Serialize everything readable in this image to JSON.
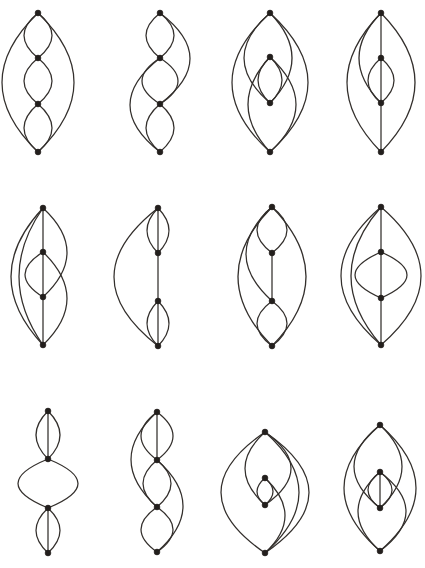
{
  "figure": {
    "background_color": "#ffffff",
    "edge_color": "#332f2c",
    "vertex_color": "#231f1d",
    "edge_stroke_width": 1.25,
    "vertex_radius": 2.9,
    "rows": 3,
    "columns": 4,
    "canvas": {
      "width": 425,
      "height": 568
    }
  },
  "chart_data": {
    "type": "diagram",
    "graphs": [
      {
        "id": "graph-1",
        "cell": {
          "row": 1,
          "column": 1
        },
        "vertex_count": 4,
        "edge_count": 8,
        "origin": {
          "x": 14,
          "y": 8
        },
        "vertices": [
          {
            "name": "v1",
            "x": 38,
            "y": 13
          },
          {
            "name": "v2",
            "x": 38,
            "y": 58
          },
          {
            "name": "v3",
            "x": 38,
            "y": 104
          },
          {
            "name": "v4",
            "x": 38,
            "y": 152
          }
        ],
        "edges": [
          {
            "from": "v1",
            "to": "v4",
            "bow": -36
          },
          {
            "from": "v1",
            "to": "v4",
            "bow": 36
          },
          {
            "from": "v1",
            "to": "v2",
            "bow": -14
          },
          {
            "from": "v1",
            "to": "v2",
            "bow": 14
          },
          {
            "from": "v2",
            "to": "v3",
            "bow": -14
          },
          {
            "from": "v2",
            "to": "v3",
            "bow": 14
          },
          {
            "from": "v3",
            "to": "v4",
            "bow": -14
          },
          {
            "from": "v3",
            "to": "v4",
            "bow": 14
          }
        ]
      },
      {
        "id": "graph-2",
        "cell": {
          "row": 1,
          "column": 2
        },
        "vertex_count": 4,
        "edge_count": 8,
        "origin": {
          "x": 122,
          "y": 8
        },
        "vertices": [
          {
            "name": "v1",
            "x": 160,
            "y": 13
          },
          {
            "name": "v2",
            "x": 160,
            "y": 58
          },
          {
            "name": "v3",
            "x": 160,
            "y": 104
          },
          {
            "name": "v4",
            "x": 160,
            "y": 152
          }
        ],
        "edges": [
          {
            "from": "v1",
            "to": "v3",
            "bow": 30
          },
          {
            "from": "v2",
            "to": "v4",
            "bow": -30
          },
          {
            "from": "v1",
            "to": "v2",
            "bow": -14
          },
          {
            "from": "v1",
            "to": "v2",
            "bow": 14
          },
          {
            "from": "v2",
            "to": "v3",
            "bow": -18
          },
          {
            "from": "v2",
            "to": "v3",
            "bow": 18
          },
          {
            "from": "v3",
            "to": "v4",
            "bow": -14
          },
          {
            "from": "v3",
            "to": "v4",
            "bow": 14
          }
        ]
      },
      {
        "id": "graph-3",
        "cell": {
          "row": 1,
          "column": 3
        },
        "vertex_count": 4,
        "edge_count": 8,
        "origin": {
          "x": 230,
          "y": 8
        },
        "vertices": [
          {
            "name": "v1",
            "x": 270,
            "y": 13
          },
          {
            "name": "v2",
            "x": 270,
            "y": 57
          },
          {
            "name": "v3",
            "x": 270,
            "y": 103
          },
          {
            "name": "v4",
            "x": 270,
            "y": 152
          }
        ],
        "edges": [
          {
            "from": "v1",
            "to": "v4",
            "bow": -38
          },
          {
            "from": "v1",
            "to": "v4",
            "bow": 38
          },
          {
            "from": "v1",
            "to": "v3",
            "bow": -26
          },
          {
            "from": "v2",
            "to": "v4",
            "bow": 26
          },
          {
            "from": "v2",
            "to": "v3",
            "bow": -12
          },
          {
            "from": "v2",
            "to": "v3",
            "bow": 12
          },
          {
            "from": "v1",
            "to": "v3",
            "bow": 22
          },
          {
            "from": "v2",
            "to": "v4",
            "bow": -22
          }
        ]
      },
      {
        "id": "graph-4",
        "cell": {
          "row": 1,
          "column": 4
        },
        "vertex_count": 4,
        "edge_count": 8,
        "origin": {
          "x": 340,
          "y": 8
        },
        "vertices": [
          {
            "name": "v1",
            "x": 381,
            "y": 13
          },
          {
            "name": "v2",
            "x": 381,
            "y": 58
          },
          {
            "name": "v3",
            "x": 381,
            "y": 103
          },
          {
            "name": "v4",
            "x": 381,
            "y": 152
          }
        ],
        "edges": [
          {
            "from": "v1",
            "to": "v4",
            "bow": -34
          },
          {
            "from": "v1",
            "to": "v4",
            "bow": 34
          },
          {
            "from": "v1",
            "to": "v2",
            "bow": 0
          },
          {
            "from": "v2",
            "to": "v3",
            "bow": 0
          },
          {
            "from": "v3",
            "to": "v4",
            "bow": 0
          },
          {
            "from": "v2",
            "to": "v3",
            "bow": -13
          },
          {
            "from": "v2",
            "to": "v3",
            "bow": 13
          },
          {
            "from": "v1",
            "to": "v3",
            "bow": -22
          }
        ]
      },
      {
        "id": "graph-5",
        "cell": {
          "row": 2,
          "column": 1
        },
        "vertex_count": 4,
        "edge_count": 8,
        "origin": {
          "x": 14,
          "y": 198
        },
        "vertices": [
          {
            "name": "v1",
            "x": 43,
            "y": 208
          },
          {
            "name": "v2",
            "x": 43,
            "y": 252
          },
          {
            "name": "v3",
            "x": 43,
            "y": 297
          },
          {
            "name": "v4",
            "x": 43,
            "y": 345
          }
        ],
        "edges": [
          {
            "from": "v1",
            "to": "v4",
            "bow": -32
          },
          {
            "from": "v1",
            "to": "v4",
            "bow": -24
          },
          {
            "from": "v1",
            "to": "v2",
            "bow": 0
          },
          {
            "from": "v2",
            "to": "v3",
            "bow": 0
          },
          {
            "from": "v3",
            "to": "v4",
            "bow": 0
          },
          {
            "from": "v1",
            "to": "v3",
            "bow": 24
          },
          {
            "from": "v2",
            "to": "v4",
            "bow": 24
          },
          {
            "from": "v2",
            "to": "v3",
            "bow": -18
          }
        ]
      },
      {
        "id": "graph-6",
        "cell": {
          "row": 2,
          "column": 2
        },
        "vertex_count": 4,
        "edge_count": 8,
        "origin": {
          "x": 122,
          "y": 198
        },
        "vertices": [
          {
            "name": "v1",
            "x": 158,
            "y": 208
          },
          {
            "name": "v2",
            "x": 158,
            "y": 253
          },
          {
            "name": "v3",
            "x": 158,
            "y": 301
          },
          {
            "name": "v4",
            "x": 158,
            "y": 346
          }
        ],
        "edges": [
          {
            "from": "v1",
            "to": "v4",
            "bow": -44
          },
          {
            "from": "v1",
            "to": "v2",
            "bow": -11
          },
          {
            "from": "v1",
            "to": "v2",
            "bow": 0
          },
          {
            "from": "v1",
            "to": "v2",
            "bow": 11
          },
          {
            "from": "v2",
            "to": "v3",
            "bow": 0
          },
          {
            "from": "v3",
            "to": "v4",
            "bow": -11
          },
          {
            "from": "v3",
            "to": "v4",
            "bow": 0
          },
          {
            "from": "v3",
            "to": "v4",
            "bow": 11
          }
        ]
      },
      {
        "id": "graph-7",
        "cell": {
          "row": 2,
          "column": 3
        },
        "vertex_count": 4,
        "edge_count": 8,
        "origin": {
          "x": 230,
          "y": 198
        },
        "vertices": [
          {
            "name": "v1",
            "x": 272,
            "y": 207
          },
          {
            "name": "v2",
            "x": 272,
            "y": 253
          },
          {
            "name": "v3",
            "x": 272,
            "y": 301
          },
          {
            "name": "v4",
            "x": 272,
            "y": 346
          }
        ],
        "edges": [
          {
            "from": "v1",
            "to": "v4",
            "bow": 34
          },
          {
            "from": "v1",
            "to": "v4",
            "bow": -34
          },
          {
            "from": "v1",
            "to": "v2",
            "bow": -15
          },
          {
            "from": "v1",
            "to": "v2",
            "bow": 15
          },
          {
            "from": "v2",
            "to": "v3",
            "bow": 0
          },
          {
            "from": "v3",
            "to": "v4",
            "bow": -15
          },
          {
            "from": "v3",
            "to": "v4",
            "bow": 15
          },
          {
            "from": "v1",
            "to": "v3",
            "bow": -26
          }
        ]
      },
      {
        "id": "graph-8",
        "cell": {
          "row": 2,
          "column": 4
        },
        "vertex_count": 4,
        "edge_count": 8,
        "origin": {
          "x": 340,
          "y": 198
        },
        "vertices": [
          {
            "name": "v1",
            "x": 381,
            "y": 207
          },
          {
            "name": "v2",
            "x": 381,
            "y": 252
          },
          {
            "name": "v3",
            "x": 381,
            "y": 298
          },
          {
            "name": "v4",
            "x": 381,
            "y": 345
          }
        ],
        "edges": [
          {
            "from": "v1",
            "to": "v4",
            "bow": -40
          },
          {
            "from": "v1",
            "to": "v4",
            "bow": 40
          },
          {
            "from": "v1",
            "to": "v4",
            "bow": -30
          },
          {
            "from": "v1",
            "to": "v2",
            "bow": 0
          },
          {
            "from": "v2",
            "to": "v3",
            "bow": 0
          },
          {
            "from": "v3",
            "to": "v4",
            "bow": 0
          },
          {
            "from": "v2",
            "to": "v3",
            "bow": -26
          },
          {
            "from": "v2",
            "to": "v3",
            "bow": 26
          }
        ]
      },
      {
        "id": "graph-9",
        "cell": {
          "row": 3,
          "column": 1
        },
        "vertex_count": 4,
        "edge_count": 8,
        "origin": {
          "x": 14,
          "y": 400
        },
        "vertices": [
          {
            "name": "v1",
            "x": 48,
            "y": 411
          },
          {
            "name": "v2",
            "x": 48,
            "y": 459
          },
          {
            "name": "v3",
            "x": 48,
            "y": 508
          },
          {
            "name": "v4",
            "x": 48,
            "y": 553
          }
        ],
        "edges": [
          {
            "from": "v1",
            "to": "v2",
            "bow": -12
          },
          {
            "from": "v1",
            "to": "v2",
            "bow": 0
          },
          {
            "from": "v1",
            "to": "v2",
            "bow": 12
          },
          {
            "from": "v2",
            "to": "v3",
            "bow": -30
          },
          {
            "from": "v2",
            "to": "v3",
            "bow": 30
          },
          {
            "from": "v3",
            "to": "v4",
            "bow": -12
          },
          {
            "from": "v3",
            "to": "v4",
            "bow": 0
          },
          {
            "from": "v3",
            "to": "v4",
            "bow": 12
          }
        ]
      },
      {
        "id": "graph-10",
        "cell": {
          "row": 3,
          "column": 2
        },
        "vertex_count": 4,
        "edge_count": 9,
        "origin": {
          "x": 122,
          "y": 400
        },
        "vertices": [
          {
            "name": "v1",
            "x": 157,
            "y": 412
          },
          {
            "name": "v2",
            "x": 157,
            "y": 460
          },
          {
            "name": "v3",
            "x": 157,
            "y": 507
          },
          {
            "name": "v4",
            "x": 157,
            "y": 552
          }
        ],
        "edges": [
          {
            "from": "v1",
            "to": "v2",
            "bow": -16
          },
          {
            "from": "v1",
            "to": "v2",
            "bow": 0
          },
          {
            "from": "v1",
            "to": "v2",
            "bow": 16
          },
          {
            "from": "v1",
            "to": "v3",
            "bow": -26
          },
          {
            "from": "v2",
            "to": "v4",
            "bow": 26
          },
          {
            "from": "v2",
            "to": "v3",
            "bow": -14
          },
          {
            "from": "v2",
            "to": "v3",
            "bow": 14
          },
          {
            "from": "v3",
            "to": "v4",
            "bow": -16
          },
          {
            "from": "v3",
            "to": "v4",
            "bow": 16
          }
        ]
      },
      {
        "id": "graph-11",
        "cell": {
          "row": 3,
          "column": 3
        },
        "vertex_count": 4,
        "edge_count": 8,
        "origin": {
          "x": 230,
          "y": 400
        },
        "vertices": [
          {
            "name": "v1",
            "x": 265,
            "y": 432
          },
          {
            "name": "v2",
            "x": 265,
            "y": 478
          },
          {
            "name": "v3",
            "x": 265,
            "y": 505
          },
          {
            "name": "v4",
            "x": 265,
            "y": 553
          }
        ],
        "edges": [
          {
            "from": "v1",
            "to": "v4",
            "bow": -44
          },
          {
            "from": "v1",
            "to": "v4",
            "bow": 44
          },
          {
            "from": "v1",
            "to": "v4",
            "bow": 34
          },
          {
            "from": "v1",
            "to": "v3",
            "bow": -20
          },
          {
            "from": "v2",
            "to": "v4",
            "bow": 20
          },
          {
            "from": "v2",
            "to": "v3",
            "bow": -8
          },
          {
            "from": "v2",
            "to": "v3",
            "bow": 8
          },
          {
            "from": "v1",
            "to": "v3",
            "bow": 26
          }
        ]
      },
      {
        "id": "graph-12",
        "cell": {
          "row": 3,
          "column": 4
        },
        "vertex_count": 4,
        "edge_count": 9,
        "origin": {
          "x": 340,
          "y": 400
        },
        "vertices": [
          {
            "name": "v1",
            "x": 380,
            "y": 425
          },
          {
            "name": "v2",
            "x": 380,
            "y": 472
          },
          {
            "name": "v3",
            "x": 380,
            "y": 508
          },
          {
            "name": "v4",
            "x": 380,
            "y": 551
          }
        ],
        "edges": [
          {
            "from": "v1",
            "to": "v4",
            "bow": -36
          },
          {
            "from": "v1",
            "to": "v4",
            "bow": 36
          },
          {
            "from": "v1",
            "to": "v3",
            "bow": -26
          },
          {
            "from": "v2",
            "to": "v4",
            "bow": 26
          },
          {
            "from": "v1",
            "to": "v3",
            "bow": 22
          },
          {
            "from": "v2",
            "to": "v4",
            "bow": -22
          },
          {
            "from": "v2",
            "to": "v3",
            "bow": -12
          },
          {
            "from": "v2",
            "to": "v3",
            "bow": 0
          },
          {
            "from": "v2",
            "to": "v3",
            "bow": 12
          }
        ]
      }
    ]
  }
}
